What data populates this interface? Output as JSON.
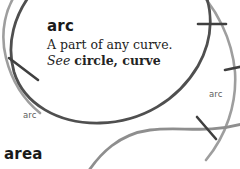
{
  "page": {
    "background_color": "#ffffff",
    "width": 240,
    "height": 169
  },
  "entry": {
    "headword": "arc",
    "definition": "A part of any curve.",
    "crossref_see": "See",
    "crossref_targets": "circle, curve"
  },
  "next_entry": {
    "headword": "area"
  },
  "diagram": {
    "labels": [
      {
        "text": "arc",
        "position": "lower-left"
      },
      {
        "text": "arc",
        "position": "right"
      }
    ],
    "colors": {
      "curve_dark": "#4d4d4d",
      "curve_light": "#9a9a9a",
      "tick": "#3f3f3f"
    }
  }
}
